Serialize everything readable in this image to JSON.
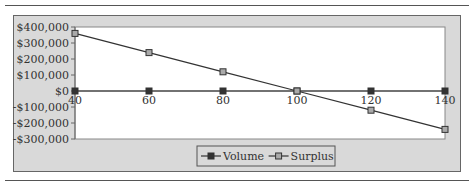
{
  "chart_data": {
    "type": "line",
    "title": "",
    "xlabel": "",
    "ylabel": "",
    "x": [
      40,
      60,
      80,
      100,
      120,
      140
    ],
    "series": [
      {
        "name": "Volume",
        "values": [
          0,
          0,
          0,
          0,
          0,
          0
        ],
        "marker": "filled-square",
        "color": "#333333"
      },
      {
        "name": "Surplus",
        "values": [
          360000,
          240000,
          120000,
          0,
          -120000,
          -240000
        ],
        "marker": "hollow-square",
        "color": "#888888"
      }
    ],
    "ylim": [
      -300000,
      400000
    ],
    "y_ticks": [
      "$400,000",
      "$300,000",
      "$200,000",
      "$100,000",
      "$0",
      "-$100,000",
      "-$200,000",
      "-$300,000"
    ],
    "x_ticks": [
      "40",
      "60",
      "80",
      "100",
      "120",
      "140"
    ],
    "grid": false,
    "legend_position": "bottom",
    "plot_background": "#ffffff",
    "chart_background": "#d9d9d9"
  },
  "legend": {
    "items": [
      {
        "label": "Volume"
      },
      {
        "label": "Surplus"
      }
    ]
  }
}
